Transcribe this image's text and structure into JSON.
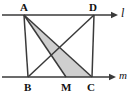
{
  "figure": {
    "width": 133,
    "height": 100,
    "background": "#ffffff",
    "stroke_color": "#3a3a3a",
    "shade_color": "#cfcfcf",
    "label_color": "#111111"
  },
  "labels": {
    "A": "A",
    "B": "B",
    "C": "C",
    "D": "D",
    "M": "M",
    "line_l": "l",
    "line_m": "m"
  },
  "points": {
    "A": {
      "x": 24,
      "y": 15
    },
    "D": {
      "x": 94,
      "y": 15
    },
    "B": {
      "x": 28,
      "y": 77
    },
    "M": {
      "x": 66,
      "y": 77
    },
    "C": {
      "x": 92,
      "y": 77
    }
  },
  "lines": {
    "l": {
      "y": 15,
      "x1": 2,
      "x2": 112,
      "arrow": "right",
      "label": "l"
    },
    "m": {
      "y": 77,
      "x1": 2,
      "x2": 112,
      "arrow": "right",
      "label": "m"
    }
  },
  "segments": [
    {
      "name": "A-B",
      "from": "A",
      "to": "B"
    },
    {
      "name": "A-M",
      "from": "A",
      "to": "M"
    },
    {
      "name": "A-C",
      "from": "A",
      "to": "C"
    },
    {
      "name": "D-B",
      "from": "D",
      "to": "B"
    },
    {
      "name": "D-C",
      "from": "D",
      "to": "C"
    }
  ],
  "shaded_region": {
    "name": "triangle-A-M-C",
    "vertices": [
      "A",
      "M",
      "C"
    ],
    "fill": "#cfcfcf"
  }
}
